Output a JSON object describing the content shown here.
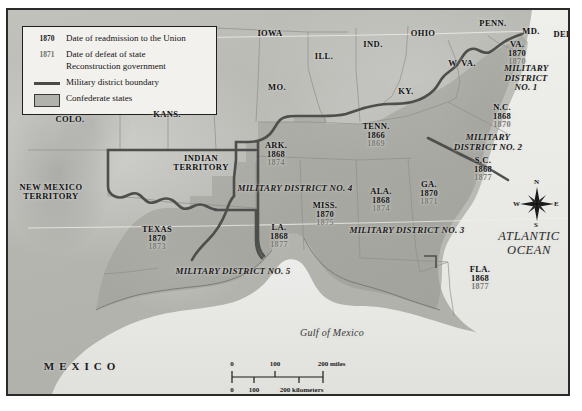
{
  "map": {
    "title": "Reconstruction Military Districts",
    "colors": {
      "confederate_fill": "#9d9d97",
      "union_fill": "#b8b8b3",
      "ocean_fill": "#e8e8e4",
      "district_boundary": "#4a4a48",
      "state_boundary": "#8a8a85",
      "frame": "#2b2b2b",
      "legend_bg": "#f2f1ed",
      "year_readmission": "#111111",
      "year_defeat": "#7a7a76"
    }
  },
  "legend": {
    "rows": [
      {
        "key_type": "year",
        "key_label": "1870",
        "muted": false,
        "text": "Date of readmission to the Union"
      },
      {
        "key_type": "year",
        "key_label": "1871",
        "muted": true,
        "text": "Date of defeat of state\nReconstruction government"
      },
      {
        "key_type": "line",
        "key_label": "",
        "muted": false,
        "text": "Military district boundary"
      },
      {
        "key_type": "box",
        "key_label": "",
        "muted": false,
        "text": "Confederate states"
      }
    ]
  },
  "confederate_states": [
    {
      "abbr": "VA.",
      "readmission": "1870",
      "defeat": "1870",
      "x": 515,
      "y": 52
    },
    {
      "abbr": "N.C.",
      "readmission": "1868",
      "defeat": "1870",
      "x": 500,
      "y": 115
    },
    {
      "abbr": "S.C.",
      "readmission": "1868",
      "defeat": "1877",
      "x": 481,
      "y": 168
    },
    {
      "abbr": "GA.",
      "readmission": "1870",
      "defeat": "1871",
      "x": 427,
      "y": 192
    },
    {
      "abbr": "FLA.",
      "readmission": "1868",
      "defeat": "1877",
      "x": 478,
      "y": 277
    },
    {
      "abbr": "ALA.",
      "readmission": "1868",
      "defeat": "1874",
      "x": 379,
      "y": 199
    },
    {
      "abbr": "MISS.",
      "readmission": "1870",
      "defeat": "1875",
      "x": 323,
      "y": 213
    },
    {
      "abbr": "TENN.",
      "readmission": "1866",
      "defeat": "1869",
      "x": 374,
      "y": 134
    },
    {
      "abbr": "ARK.",
      "readmission": "1868",
      "defeat": "1874",
      "x": 274,
      "y": 153
    },
    {
      "abbr": "LA.",
      "readmission": "1868",
      "defeat": "1877",
      "x": 277,
      "y": 235
    },
    {
      "abbr": "TEXAS",
      "readmission": "1870",
      "defeat": "1873",
      "x": 155,
      "y": 237
    }
  ],
  "union_labels": [
    {
      "name": "IOWA",
      "x": 268,
      "y": 32
    },
    {
      "name": "ILL.",
      "x": 322,
      "y": 55
    },
    {
      "name": "IND.",
      "x": 371,
      "y": 43
    },
    {
      "name": "OHIO",
      "x": 421,
      "y": 32
    },
    {
      "name": "PENN.",
      "x": 491,
      "y": 22
    },
    {
      "name": "MD.",
      "x": 529,
      "y": 30
    },
    {
      "name": "DEL.",
      "x": 562,
      "y": 33
    },
    {
      "name": "W. VA.",
      "x": 460,
      "y": 62
    },
    {
      "name": "KY.",
      "x": 404,
      "y": 90
    },
    {
      "name": "MO.",
      "x": 275,
      "y": 86
    },
    {
      "name": "KANS.",
      "x": 165,
      "y": 113
    },
    {
      "name": "COLO.",
      "x": 68,
      "y": 118
    }
  ],
  "territories": [
    {
      "name": "INDIAN\nTERRITORY",
      "x": 199,
      "y": 161
    },
    {
      "name": "NEW MEXICO\nTERRITORY",
      "x": 49,
      "y": 190
    }
  ],
  "military_districts": [
    {
      "label": "MILITARY DISTRICT\nNO. 1",
      "x": 524,
      "y": 77,
      "rotate": 0
    },
    {
      "label": "MILITARY DISTRICT NO. 2",
      "x": 486,
      "y": 141,
      "rotate": 0
    },
    {
      "label": "MILITARY DISTRICT NO. 3",
      "x": 405,
      "y": 229,
      "rotate": 0
    },
    {
      "label": "MILITARY DISTRICT NO. 4",
      "x": 293,
      "y": 187,
      "rotate": 0
    },
    {
      "label": "MILITARY DISTRICT NO. 5",
      "x": 231,
      "y": 270,
      "rotate": 0
    }
  ],
  "water_labels": [
    {
      "name": "ATLANTIC\nOCEAN",
      "x": 527,
      "y": 241
    },
    {
      "name": "Gulf of Mexico",
      "x": 330,
      "y": 331
    }
  ],
  "country_labels": [
    {
      "name": "MEXICO",
      "x": 80,
      "y": 365
    }
  ],
  "compass": {
    "north": "N",
    "south": "S",
    "east": "E",
    "west": "W"
  },
  "scale": {
    "miles": {
      "ticks": [
        "0",
        "100",
        "200"
      ],
      "unit": "miles"
    },
    "kilometers": {
      "ticks": [
        "0",
        "100",
        "200"
      ],
      "unit": "kilometers"
    }
  }
}
